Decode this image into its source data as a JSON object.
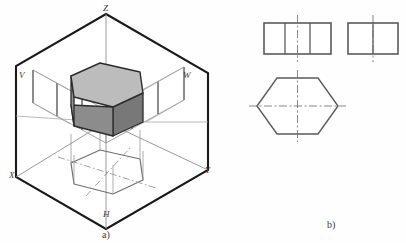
{
  "figure": {
    "background_color": "#fefefe",
    "parts": [
      {
        "id": "a",
        "caption": "a)",
        "description": "pictorial view of hexagonal prism inside three projection planes"
      },
      {
        "id": "b",
        "caption": "b)",
        "description": "three orthographic views of the hexagonal prism"
      }
    ]
  },
  "part_a": {
    "caption": "a)",
    "axis_labels": {
      "z": "Z",
      "x": "X",
      "y": "Y"
    },
    "plane_labels": {
      "v": "V",
      "w": "W",
      "h": "H"
    },
    "colors": {
      "outline": "#1a1a1a",
      "construction": "#8f8f8f",
      "solid_top": "#b9b9b9",
      "solid_left": "#8c8c8c",
      "solid_right": "#787878",
      "solid_edge": "#2b2b2b"
    }
  },
  "part_b": {
    "caption": "b)",
    "views": [
      {
        "name": "front-view",
        "label": "",
        "shape": "rectangle",
        "divisions": 3,
        "centerline": "vertical"
      },
      {
        "name": "side-view",
        "label": "",
        "shape": "rectangle",
        "divisions": 2,
        "centerline": "vertical"
      },
      {
        "name": "top-view",
        "label": "",
        "shape": "hexagon",
        "divisions": 0,
        "centerline": "vertical-and-horizontal"
      }
    ],
    "colors": {
      "outline": "#5a5a5a",
      "centerline": "#6a6a6a"
    }
  }
}
